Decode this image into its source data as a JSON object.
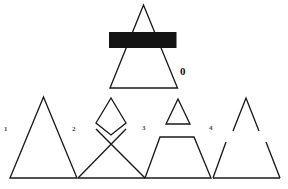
{
  "sheet": {
    "kind": "visual-reasoning-figure",
    "background_color": "#ffffff",
    "ink_color": "#1a1a1a",
    "occluder_color": "#141414",
    "width": 288,
    "height": 189
  },
  "target": {
    "label": "0",
    "description": "triangle partially occluded by a solid black horizontal bar",
    "shape": "triangle",
    "occluder": "black-bar"
  },
  "options": [
    {
      "label": "1",
      "description": "plain upright triangle, unbroken outline",
      "shape": "triangle"
    },
    {
      "label": "2",
      "description": "triangle whose upper section is folded so the sides cross in an X",
      "shape": "crossed-triangle"
    },
    {
      "label": "3",
      "description": "trapezoid with a small separate triangle floating above it",
      "shape": "trapezoid-plus-triangle"
    },
    {
      "label": "4",
      "description": "triangle outline with a horizontal gap splitting apex from base",
      "shape": "split-triangle"
    }
  ],
  "geometry": {
    "target": {
      "apex": [
        143.5,
        5
      ],
      "base_left": [
        110,
        88
      ],
      "base_right": [
        177.5,
        88
      ],
      "bar": {
        "x": 109,
        "y": 32,
        "width": 67.5,
        "height": 16
      }
    },
    "option1": {
      "apex": [
        43.5,
        97
      ],
      "base_left": [
        10,
        178
      ],
      "base_right": [
        77,
        178
      ]
    },
    "option2": {
      "top_apex": [
        111,
        98
      ],
      "cross": [
        111,
        135
      ],
      "upper_left": [
        96,
        124
      ],
      "upper_right": [
        126,
        124
      ],
      "base_left": [
        78,
        178
      ],
      "base_right": [
        145,
        178
      ]
    },
    "option3": {
      "small_apex": [
        178,
        99
      ],
      "small_base_left": [
        166,
        124
      ],
      "small_base_right": [
        190,
        124
      ],
      "trap_top_left": [
        160,
        137
      ],
      "trap_top_right": [
        194,
        137
      ],
      "base_left": [
        145,
        178
      ],
      "base_right": [
        211,
        178
      ]
    },
    "option4": {
      "apex": [
        246,
        98
      ],
      "upper_left_end": [
        233,
        131
      ],
      "upper_right_end": [
        259,
        131
      ],
      "lower_left_start": [
        226,
        142
      ],
      "lower_right_start": [
        266,
        142
      ],
      "base_left": [
        213,
        178
      ],
      "base_right": [
        280,
        178
      ]
    }
  }
}
